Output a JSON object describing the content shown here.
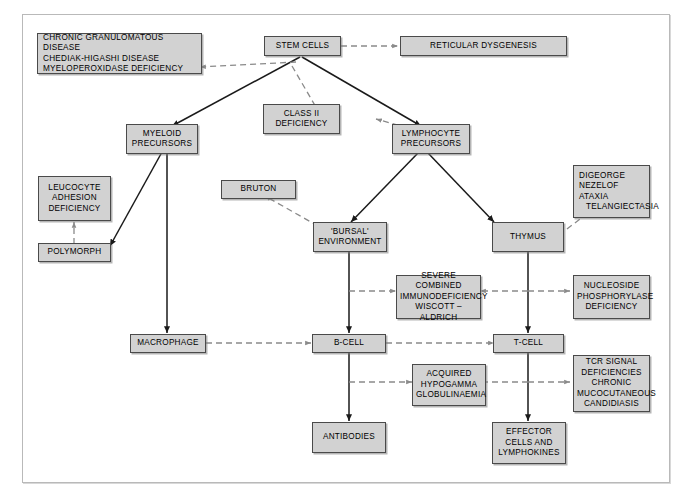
{
  "figure": {
    "background": "#ffffff",
    "node_fill": "#d2d2d2",
    "node_border": "#4a4a4a",
    "solid_line_color": "#1a1a1a",
    "dashed_line_color": "#8a8a8a"
  },
  "nodes": {
    "chronic_granulomatous": {
      "lines": [
        "CHRONIC GRANULOMATOUS DISEASE",
        "CHEDIAK-HIGASHI DISEASE",
        "MYELOPEROXIDASE DEFICIENCY"
      ]
    },
    "stem_cells": {
      "lines": [
        "STEM CELLS"
      ]
    },
    "reticular_dysgenesis": {
      "lines": [
        "RETICULAR DYSGENESIS"
      ]
    },
    "class_ii_deficiency": {
      "lines": [
        "CLASS II",
        "DEFICIENCY"
      ]
    },
    "myeloid_precursors": {
      "lines": [
        "MYELOID",
        "PRECURSORS"
      ]
    },
    "lymphocyte_precursors": {
      "lines": [
        "LYMPHOCYTE",
        "PRECURSORS"
      ]
    },
    "leucocyte_adhesion": {
      "lines": [
        "LEUCOCYTE",
        "ADHESION",
        "DEFICIENCY"
      ]
    },
    "bruton": {
      "lines": [
        "BRUTON"
      ]
    },
    "digeorge": {
      "lines": [
        "DIGEORGE",
        "NEZELOF",
        "ATAXIA"
      ],
      "indented": "TELANGIECTASIA"
    },
    "polymorph": {
      "lines": [
        "POLYMORPH"
      ]
    },
    "bursal_environment": {
      "lines": [
        "'BURSAL'",
        "ENVIRONMENT"
      ]
    },
    "thymus": {
      "lines": [
        "THYMUS"
      ]
    },
    "severe_combined": {
      "lines": [
        "SEVERE COMBINED",
        "IMMUNODEFICIENCY",
        "WISCOTT – ALDRICH"
      ]
    },
    "nucleoside_phosphorylase": {
      "lines": [
        "NUCLEOSIDE",
        "PHOSPHORYLASE",
        "DEFICIENCY"
      ]
    },
    "macrophage": {
      "lines": [
        "MACROPHAGE"
      ]
    },
    "b_cell": {
      "lines": [
        "B-CELL"
      ]
    },
    "t_cell": {
      "lines": [
        "T-CELL"
      ]
    },
    "tcr_signal": {
      "lines": [
        "TCR SIGNAL",
        "DEFICIENCIES",
        "CHRONIC",
        "MUCOCUTANEOUS",
        "CANDIDIASIS"
      ]
    },
    "acquired_hypogamma": {
      "lines": [
        "ACQUIRED",
        "HYPOGAMMA",
        "GLOBULINAEMIA"
      ]
    },
    "antibodies": {
      "lines": [
        "ANTIBODIES"
      ]
    },
    "effector_cells": {
      "lines": [
        "EFFECTOR",
        "CELLS AND",
        "LYMPHOKINES"
      ]
    }
  },
  "edges": [
    {
      "from": "stem_cells",
      "to": "reticular_dysgenesis",
      "style": "dashed"
    },
    {
      "from": "stem_cells",
      "to": "chronic_granulomatous",
      "style": "dashed"
    },
    {
      "from": "stem_cells",
      "to": "myeloid_precursors",
      "style": "solid"
    },
    {
      "from": "stem_cells",
      "to": "lymphocyte_precursors",
      "style": "solid"
    },
    {
      "from": "stem_cells",
      "to": "class_ii_deficiency",
      "style": "dashed"
    },
    {
      "from": "lymphocyte_precursors",
      "to": "class_ii_deficiency",
      "style": "dashed"
    },
    {
      "from": "myeloid_precursors",
      "to": "polymorph",
      "style": "solid"
    },
    {
      "from": "myeloid_precursors",
      "to": "macrophage",
      "style": "solid"
    },
    {
      "from": "polymorph",
      "to": "leucocyte_adhesion",
      "style": "dashed"
    },
    {
      "from": "lymphocyte_precursors",
      "to": "bursal_environment",
      "style": "solid"
    },
    {
      "from": "lymphocyte_precursors",
      "to": "thymus",
      "style": "solid"
    },
    {
      "from": "bursal_environment",
      "to": "bruton",
      "style": "dashed"
    },
    {
      "from": "thymus",
      "to": "digeorge",
      "style": "dashed"
    },
    {
      "from": "bursal_environment",
      "to": "b_cell",
      "style": "solid"
    },
    {
      "from": "thymus",
      "to": "t_cell",
      "style": "solid"
    },
    {
      "from": "bursal_environment_line",
      "to": "severe_combined",
      "style": "dashed"
    },
    {
      "from": "thymus_line",
      "to": "severe_combined",
      "style": "dashed"
    },
    {
      "from": "thymus_line",
      "to": "nucleoside_phosphorylase",
      "style": "dashed"
    },
    {
      "from": "macrophage",
      "to": "b_cell",
      "style": "dashed"
    },
    {
      "from": "b_cell",
      "to": "t_cell",
      "style": "dashed"
    },
    {
      "from": "b_cell",
      "to": "antibodies",
      "style": "solid"
    },
    {
      "from": "t_cell",
      "to": "effector_cells",
      "style": "solid"
    },
    {
      "from": "b_cell_line",
      "to": "acquired_hypogamma",
      "style": "dashed"
    },
    {
      "from": "t_cell_line",
      "to": "acquired_hypogamma",
      "style": "dashed"
    },
    {
      "from": "t_cell_line",
      "to": "tcr_signal",
      "style": "dashed"
    }
  ]
}
